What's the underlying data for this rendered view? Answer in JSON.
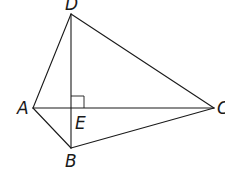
{
  "diagram": {
    "type": "geometry-quadrilateral",
    "points": {
      "A": {
        "label": "A",
        "x": 33,
        "y": 108
      },
      "B": {
        "label": "B",
        "x": 71,
        "y": 148
      },
      "C": {
        "label": "C",
        "x": 214,
        "y": 108
      },
      "D": {
        "label": "D",
        "x": 71,
        "y": 14
      },
      "E": {
        "label": "E",
        "x": 71,
        "y": 108
      }
    },
    "segments": [
      "AD",
      "DC",
      "CB",
      "BA",
      "AC",
      "DB"
    ],
    "right_angle_at": "E",
    "labels": {
      "A": "A",
      "B": "B",
      "C": "C",
      "D": "D",
      "E": "E"
    },
    "stroke_color": "#1a1a1a",
    "background": "#ffffff"
  }
}
